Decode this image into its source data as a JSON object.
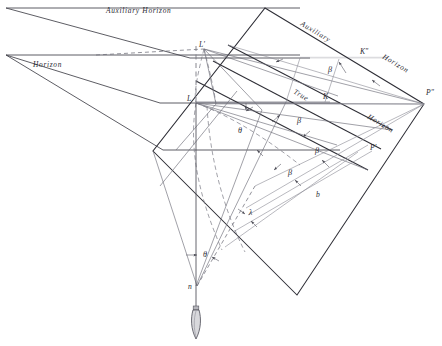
{
  "figure": {
    "background_color": "#ffffff",
    "line_color": "#4b4b52",
    "text_color": "#2b2b33",
    "width": 442,
    "height": 346
  },
  "horizon_labels": {
    "auxiliary_left": "Auxiliary  Horizon",
    "horizon_left": "Horizon",
    "auxiliary_diag_word1": "Auxiliary",
    "auxiliary_diag_word2": "Horizon",
    "true_diag_word1": "True",
    "true_diag_word2": "Horizon"
  },
  "point_labels": {
    "l_prime": "L'",
    "l": "L",
    "k_double_prime": "Kʺ",
    "k": "K",
    "p_double_prime": "Pʺ",
    "p_prime": "P'",
    "n": "n",
    "b": "b",
    "lambda": "λ"
  },
  "angle_labels": {
    "beta_1": "β",
    "beta_2": "β",
    "beta_3": "β",
    "beta_4": "β",
    "theta_1": "θ",
    "theta_2": "θ"
  },
  "elements": {
    "plumb_bob": "plumb-bob",
    "vertical_axis": "vertical-plumb-line",
    "aux_plane": "auxiliary-horizon-plane",
    "true_plane": "true-horizon-plane",
    "tilted_plane": "tilted-picture-plane"
  }
}
